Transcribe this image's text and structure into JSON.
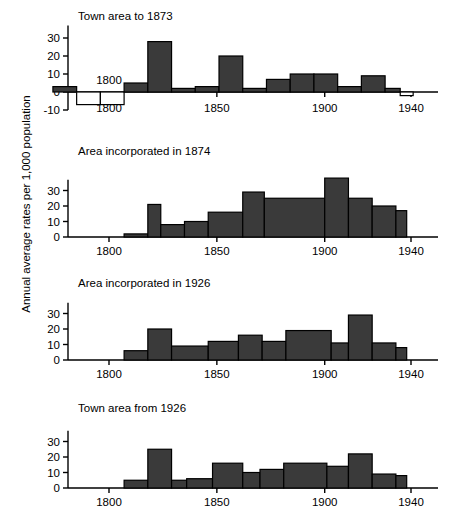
{
  "figure": {
    "ylabel": "Annual average rates per 1,000 population",
    "width": 451,
    "height": 514,
    "bar_fill": "#3a3a3a",
    "bar_stroke": "#000000",
    "axis_color": "#000000"
  },
  "chart_data": [
    {
      "type": "bar",
      "title": "Town area to 1873",
      "panel_index": 0,
      "xlabel": "",
      "ylabel": "Annual average rates per 1,000 population",
      "xlim": [
        1770,
        1945
      ],
      "ylim": [
        -10,
        38
      ],
      "yticks": [
        -10,
        0,
        10,
        20,
        30
      ],
      "ytick_labels": [
        "-10",
        "0",
        "10",
        "20",
        "30"
      ],
      "xticks": [
        1800,
        1850,
        1900,
        1940
      ],
      "xtick_labels": [
        "1800",
        "1850",
        "1900",
        "1940"
      ],
      "grid": false,
      "legend": "none",
      "annotations": [
        {
          "text": "1800",
          "x": 1800,
          "y": 4,
          "note": "inline year label above the negative bin"
        }
      ],
      "bins": [
        {
          "start": 1774,
          "end": 1785,
          "value": 3
        },
        {
          "start": 1785,
          "end": 1796,
          "value": -7
        },
        {
          "start": 1796,
          "end": 1807,
          "value": -7
        },
        {
          "start": 1807,
          "end": 1818,
          "value": 5
        },
        {
          "start": 1818,
          "end": 1829,
          "value": 28
        },
        {
          "start": 1829,
          "end": 1840,
          "value": 2
        },
        {
          "start": 1840,
          "end": 1851,
          "value": 3
        },
        {
          "start": 1851,
          "end": 1862,
          "value": 20
        },
        {
          "start": 1862,
          "end": 1873,
          "value": 2
        },
        {
          "start": 1873,
          "end": 1884,
          "value": 7
        },
        {
          "start": 1884,
          "end": 1895,
          "value": 10
        },
        {
          "start": 1895,
          "end": 1906,
          "value": 10
        },
        {
          "start": 1906,
          "end": 1917,
          "value": 3
        },
        {
          "start": 1917,
          "end": 1928,
          "value": 9
        },
        {
          "start": 1928,
          "end": 1935,
          "value": 2
        },
        {
          "start": 1935,
          "end": 1941,
          "value": -2
        }
      ]
    },
    {
      "type": "bar",
      "title": "Area incorporated in 1874",
      "panel_index": 1,
      "xlabel": "",
      "ylabel": "",
      "xlim": [
        1770,
        1945
      ],
      "ylim": [
        0,
        40
      ],
      "yticks": [
        0,
        10,
        20,
        30
      ],
      "ytick_labels": [
        "0",
        "10",
        "20",
        "30"
      ],
      "xticks": [
        1800,
        1850,
        1900,
        1940
      ],
      "xtick_labels": [
        "1800",
        "1850",
        "1900",
        "1940"
      ],
      "grid": false,
      "legend": "none",
      "annotations": [],
      "bins": [
        {
          "start": 1807,
          "end": 1818,
          "value": 2
        },
        {
          "start": 1818,
          "end": 1824,
          "value": 21
        },
        {
          "start": 1824,
          "end": 1835,
          "value": 8
        },
        {
          "start": 1835,
          "end": 1846,
          "value": 10
        },
        {
          "start": 1846,
          "end": 1862,
          "value": 16
        },
        {
          "start": 1862,
          "end": 1872,
          "value": 29
        },
        {
          "start": 1872,
          "end": 1900,
          "value": 25
        },
        {
          "start": 1900,
          "end": 1911,
          "value": 38
        },
        {
          "start": 1911,
          "end": 1922,
          "value": 25
        },
        {
          "start": 1922,
          "end": 1933,
          "value": 20
        },
        {
          "start": 1933,
          "end": 1938,
          "value": 17
        }
      ]
    },
    {
      "type": "bar",
      "title": "Area incorporated in 1926",
      "panel_index": 2,
      "xlabel": "",
      "ylabel": "",
      "xlim": [
        1770,
        1945
      ],
      "ylim": [
        0,
        40
      ],
      "yticks": [
        0,
        10,
        20,
        30
      ],
      "ytick_labels": [
        "0",
        "10",
        "20",
        "30"
      ],
      "xticks": [
        1800,
        1850,
        1900,
        1940
      ],
      "xtick_labels": [
        "1800",
        "1850",
        "1900",
        "1940"
      ],
      "grid": false,
      "legend": "none",
      "annotations": [],
      "bins": [
        {
          "start": 1807,
          "end": 1818,
          "value": 6
        },
        {
          "start": 1818,
          "end": 1829,
          "value": 20
        },
        {
          "start": 1829,
          "end": 1846,
          "value": 9
        },
        {
          "start": 1846,
          "end": 1860,
          "value": 12
        },
        {
          "start": 1860,
          "end": 1871,
          "value": 16
        },
        {
          "start": 1871,
          "end": 1882,
          "value": 12
        },
        {
          "start": 1882,
          "end": 1903,
          "value": 19
        },
        {
          "start": 1903,
          "end": 1911,
          "value": 11
        },
        {
          "start": 1911,
          "end": 1922,
          "value": 29
        },
        {
          "start": 1922,
          "end": 1933,
          "value": 11
        },
        {
          "start": 1933,
          "end": 1938,
          "value": 8
        }
      ]
    },
    {
      "type": "bar",
      "title": "Town area from 1926",
      "panel_index": 3,
      "xlabel": "",
      "ylabel": "",
      "xlim": [
        1770,
        1945
      ],
      "ylim": [
        0,
        40
      ],
      "yticks": [
        0,
        10,
        20,
        30
      ],
      "ytick_labels": [
        "0",
        "10",
        "20",
        "30"
      ],
      "xticks": [
        1800,
        1850,
        1900,
        1940
      ],
      "xtick_labels": [
        "1800",
        "1850",
        "1900",
        "1940"
      ],
      "grid": false,
      "legend": "none",
      "annotations": [],
      "bins": [
        {
          "start": 1807,
          "end": 1818,
          "value": 5
        },
        {
          "start": 1818,
          "end": 1829,
          "value": 25
        },
        {
          "start": 1829,
          "end": 1836,
          "value": 5
        },
        {
          "start": 1836,
          "end": 1848,
          "value": 6
        },
        {
          "start": 1848,
          "end": 1862,
          "value": 16
        },
        {
          "start": 1862,
          "end": 1870,
          "value": 10
        },
        {
          "start": 1870,
          "end": 1881,
          "value": 12
        },
        {
          "start": 1881,
          "end": 1901,
          "value": 16
        },
        {
          "start": 1901,
          "end": 1911,
          "value": 14
        },
        {
          "start": 1911,
          "end": 1922,
          "value": 22
        },
        {
          "start": 1922,
          "end": 1933,
          "value": 9
        },
        {
          "start": 1933,
          "end": 1938,
          "value": 8
        }
      ]
    }
  ]
}
